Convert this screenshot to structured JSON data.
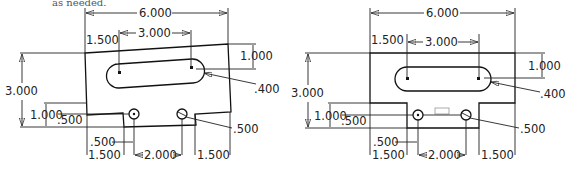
{
  "caption_fragment": "as needed.",
  "drawings": [
    {
      "name": "skewed-part",
      "dimensions": {
        "overall_width": "6.000",
        "slot_left_offset": "1.500",
        "slot_length": "3.000",
        "slot_vertical": "1.000",
        "slot_radius": ".400",
        "overall_height": "3.000",
        "tab_height": "1.000",
        "hole_offset": ".500",
        "hole_diameter": ".500",
        "notch_width": ".500",
        "left_step": "1.500",
        "hole_spacing": "2.000",
        "right_step": "1.500"
      }
    },
    {
      "name": "corrected-part",
      "dimensions": {
        "overall_width": "6.000",
        "slot_left_offset": "1.500",
        "slot_length": "3.000",
        "slot_vertical": "1.000",
        "slot_radius": ".400",
        "overall_height": "3.000",
        "tab_height": "1.000",
        "hole_offset": ".500",
        "hole_diameter": ".500",
        "notch_width": ".500",
        "left_step": "1.500",
        "hole_spacing": "2.000",
        "right_step": "1.500"
      }
    }
  ]
}
